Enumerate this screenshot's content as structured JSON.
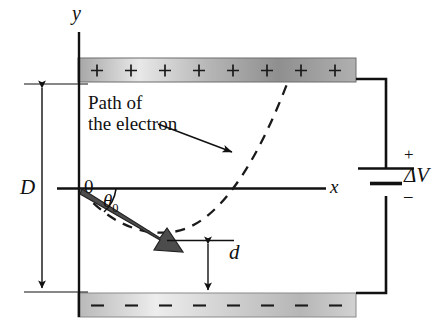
{
  "figure": {
    "colors": {
      "ink": "#111111",
      "plate_light": "#e4e4e4",
      "plate_dark": "#9a9a9a",
      "arrow_fill": "#4a4a4a",
      "background": "#ffffff"
    },
    "axes": {
      "y_label": "y",
      "x_label": "x",
      "origin_label": "0"
    },
    "labels": {
      "path_line1": "Path of",
      "path_line2": "the electron",
      "plate_separation": "D",
      "distance_to_bottom_plate": "d",
      "launch_angle": "θ",
      "launch_angle_sub": "0",
      "potential_difference": "ΔV"
    },
    "top_plate": {
      "charge_symbol": "+",
      "charge_count": 8,
      "name": "positively-charged-plate"
    },
    "bottom_plate": {
      "charge_symbol": "–",
      "charge_count": 8,
      "name": "negatively-charged-plate"
    },
    "battery": {
      "positive_terminal": "+",
      "negative_terminal": "–",
      "label": "ΔV"
    }
  }
}
